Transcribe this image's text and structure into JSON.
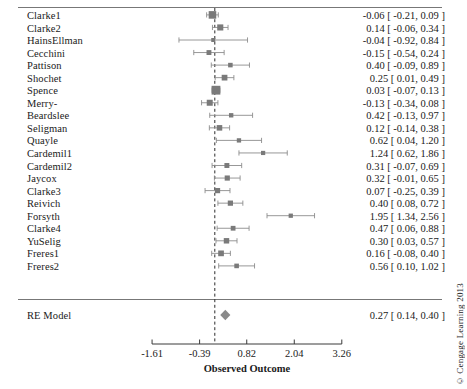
{
  "figure": {
    "title": "",
    "axis_title": "Observed Outcome",
    "credit": "© Cengage Learning 2013",
    "colors": {
      "marker": "#7a7a7a",
      "whisker": "#8c8c8c",
      "axis": "#3a3a3a",
      "rule": "#777777",
      "refline": "#2b2b2b",
      "diamond": "#8a8a8a",
      "background": "#ffffff"
    }
  },
  "chart_data": {
    "type": "forest",
    "title": "",
    "xlabel": "Observed Outcome",
    "ylabel": "",
    "xlim": [
      -1.92,
      3.65
    ],
    "xticks": [
      -1.61,
      -0.39,
      0.82,
      2.04,
      3.26
    ],
    "xticklabels": [
      "-1.61",
      "-0.39",
      "0.82",
      "2.04",
      "3.26"
    ],
    "reference_line": 0,
    "grid": false,
    "legend": "none",
    "columns": [
      "Study",
      "Estimate",
      "CI lower",
      "CI upper"
    ],
    "studies": [
      {
        "label": "Clarke1",
        "estimate": -0.06,
        "ci_lo": -0.21,
        "ci_hi": 0.09,
        "weight": 0.78,
        "text": "-0.06 [ -0.21, 0.09 ]"
      },
      {
        "label": "Clarke2",
        "estimate": 0.14,
        "ci_lo": -0.06,
        "ci_hi": 0.34,
        "weight": 0.52,
        "text": "0.14 [ -0.06, 0.34 ]"
      },
      {
        "label": "HainsEllman",
        "estimate": -0.04,
        "ci_lo": -0.92,
        "ci_hi": 0.84,
        "weight": 0.14,
        "text": "-0.04 [ -0.92, 0.84 ]"
      },
      {
        "label": "Cecchini",
        "estimate": -0.15,
        "ci_lo": -0.54,
        "ci_hi": 0.24,
        "weight": 0.3,
        "text": "-0.15 [ -0.54, 0.24 ]"
      },
      {
        "label": "Pattison",
        "estimate": 0.4,
        "ci_lo": -0.09,
        "ci_hi": 0.89,
        "weight": 0.24,
        "text": "0.40 [ -0.09, 0.89 ]"
      },
      {
        "label": "Shochet",
        "estimate": 0.25,
        "ci_lo": 0.01,
        "ci_hi": 0.49,
        "weight": 0.45,
        "text": "0.25 [  0.01, 0.49 ]"
      },
      {
        "label": "Spence",
        "estimate": 0.03,
        "ci_lo": -0.07,
        "ci_hi": 0.13,
        "weight": 1.0,
        "text": "0.03 [ -0.07, 0.13 ]"
      },
      {
        "label": "Merry-",
        "estimate": -0.13,
        "ci_lo": -0.34,
        "ci_hi": 0.08,
        "weight": 0.5,
        "text": "-0.13 [ -0.34, 0.08 ]"
      },
      {
        "label": "Beardslee",
        "estimate": 0.42,
        "ci_lo": -0.13,
        "ci_hi": 0.97,
        "weight": 0.21,
        "text": "0.42 [ -0.13, 0.97 ]"
      },
      {
        "label": "Seligman",
        "estimate": 0.12,
        "ci_lo": -0.14,
        "ci_hi": 0.38,
        "weight": 0.42,
        "text": "0.12 [ -0.14, 0.38 ]"
      },
      {
        "label": "Quayle",
        "estimate": 0.62,
        "ci_lo": 0.04,
        "ci_hi": 1.2,
        "weight": 0.2,
        "text": "0.62 [  0.04, 1.20 ]"
      },
      {
        "label": "Cardemil1",
        "estimate": 1.24,
        "ci_lo": 0.62,
        "ci_hi": 1.86,
        "weight": 0.18,
        "text": "1.24 [  0.62, 1.86 ]"
      },
      {
        "label": "Cardemil2",
        "estimate": 0.31,
        "ci_lo": -0.07,
        "ci_hi": 0.69,
        "weight": 0.31,
        "text": "0.31 [ -0.07, 0.69 ]"
      },
      {
        "label": "Jaycox",
        "estimate": 0.32,
        "ci_lo": -0.01,
        "ci_hi": 0.65,
        "weight": 0.35,
        "text": "0.32 [ -0.01, 0.65 ]"
      },
      {
        "label": "Clarke3",
        "estimate": 0.07,
        "ci_lo": -0.25,
        "ci_hi": 0.39,
        "weight": 0.36,
        "text": "0.07 [ -0.25, 0.39 ]"
      },
      {
        "label": "Reivich",
        "estimate": 0.4,
        "ci_lo": 0.08,
        "ci_hi": 0.72,
        "weight": 0.36,
        "text": "0.40 [  0.08, 0.72 ]"
      },
      {
        "label": "Forsyth",
        "estimate": 1.95,
        "ci_lo": 1.34,
        "ci_hi": 2.56,
        "weight": 0.19,
        "text": "1.95 [  1.34, 2.56 ]"
      },
      {
        "label": "Clarke4",
        "estimate": 0.47,
        "ci_lo": 0.06,
        "ci_hi": 0.88,
        "weight": 0.28,
        "text": "0.47 [  0.06, 0.88 ]"
      },
      {
        "label": "YuSelig",
        "estimate": 0.3,
        "ci_lo": 0.03,
        "ci_hi": 0.57,
        "weight": 0.4,
        "text": "0.30 [  0.03, 0.57 ]"
      },
      {
        "label": "Freres1",
        "estimate": 0.16,
        "ci_lo": -0.08,
        "ci_hi": 0.4,
        "weight": 0.45,
        "text": "0.16 [ -0.08, 0.40 ]"
      },
      {
        "label": "Freres2",
        "estimate": 0.56,
        "ci_lo": 0.1,
        "ci_hi": 1.02,
        "weight": 0.25,
        "text": "0.56 [  0.10, 1.02 ]"
      }
    ],
    "summary": {
      "label": "RE Model",
      "estimate": 0.27,
      "ci_lo": 0.14,
      "ci_hi": 0.4,
      "text": "0.27 [  0.14, 0.40 ]"
    }
  }
}
